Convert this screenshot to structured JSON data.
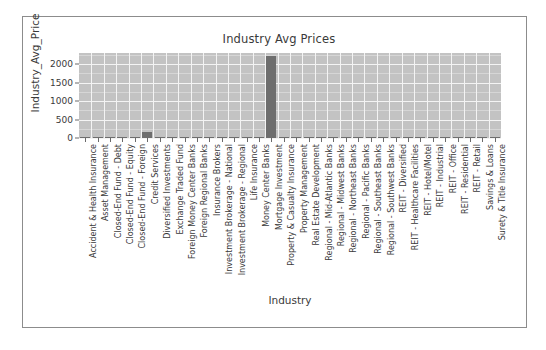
{
  "figure": {
    "border_color": "#8c8c8c",
    "canvas_color": "#ffffff"
  },
  "chart_data": {
    "type": "bar",
    "title": "Industry Avg Prices",
    "xlabel": "Industry",
    "ylabel": "Industry_Avg_Price",
    "ylim": [
      0,
      2300
    ],
    "yticks": [
      0,
      500,
      1000,
      1500,
      2000
    ],
    "ytick_labels": [
      "0",
      "500",
      "1000",
      "1500",
      "2000"
    ],
    "grid": true,
    "legend": "none",
    "plot_bg_color": "#c3c3c3",
    "grid_color": "#f4f4f4",
    "bar_color": "#6e6e6e",
    "categories": [
      "Accident & Health Insurance",
      "Asset Management",
      "Closed-End Fund - Debt",
      "Closed-End Fund - Equity",
      "Closed-End Fund - Foreign",
      "Credit Services",
      "Diversified Investments",
      "Exchange Traded Fund",
      "Foreign Money Center Banks",
      "Foreign Regional Banks",
      "Insurance Brokers",
      "Investment Brokerage - National",
      "Investment Brokerage - Regional",
      "Life Insurance",
      "Money Center Banks",
      "Mortgage Investment",
      "Property & Casualty Insurance",
      "Property Management",
      "Real Estate Development",
      "Regional - Mid-Atlantic Banks",
      "Regional - Midwest Banks",
      "Regional - Northeast Banks",
      "Regional - Pacific Banks",
      "Regional - Southeast Banks",
      "Regional - Southwest Banks",
      "REIT - Diversified",
      "REIT - Healthcare Facilities",
      "REIT - Hotel/Motel",
      "REIT - Industrial",
      "REIT - Office",
      "REIT - Residential",
      "REIT - Retail",
      "Savings & Loans",
      "Surety & Title Insurance"
    ],
    "values": [
      18,
      22,
      12,
      14,
      10,
      155,
      9,
      16,
      13,
      11,
      30,
      24,
      20,
      28,
      34,
      2210,
      40,
      12,
      15,
      26,
      23,
      27,
      25,
      22,
      21,
      31,
      38,
      19,
      29,
      33,
      36,
      35,
      17,
      24
    ]
  }
}
